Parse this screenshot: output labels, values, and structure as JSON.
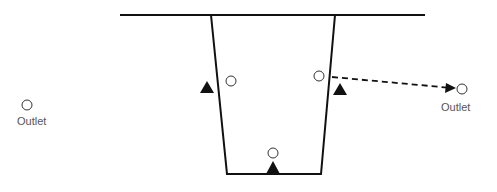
{
  "diagram": {
    "type": "channel cross-section with outlets",
    "labels": {
      "left_outlet": "Outlet",
      "right_outlet": "Outlet"
    },
    "elements": {
      "ground_line": "horizontal surface line",
      "channel": "trapezoidal channel",
      "markers": [
        "triangle-left-wall",
        "circle-left-wall",
        "circle-right-wall",
        "triangle-right-wall",
        "circle-bottom",
        "triangle-bottom"
      ],
      "arrow": "dashed arrow from right-wall circle to right outlet"
    },
    "colors": {
      "line": "#111111",
      "text": "#555555"
    }
  }
}
